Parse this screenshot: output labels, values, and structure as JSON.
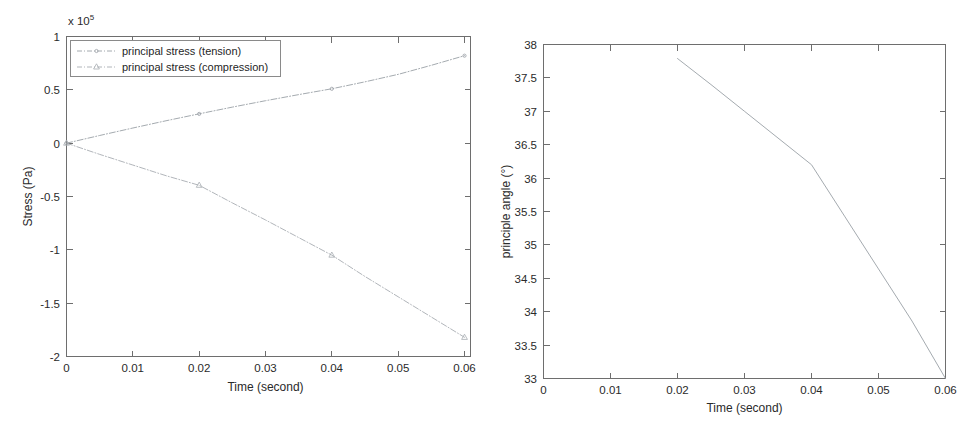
{
  "figures": {
    "stress": {
      "name": "principal stress vs time",
      "exponent_label": "x 10",
      "exponent_power": "5",
      "xlabel": "Time (second)",
      "ylabel": "Stress (Pa)",
      "xticks": [
        "0",
        "0.01",
        "0.02",
        "0.03",
        "0.04",
        "0.05",
        "0.06"
      ],
      "yticks": [
        "1",
        "0.5",
        "0",
        "-0.5",
        "-1",
        "-1.5",
        "-2"
      ],
      "legend": {
        "item1": "principal stress (tension)",
        "item2": "principal stress (compression)"
      }
    },
    "angle": {
      "name": "principle angle vs time",
      "xlabel": "Time (second)",
      "ylabel": "principle angle (°)",
      "xticks": [
        "0",
        "0.01",
        "0.02",
        "0.03",
        "0.04",
        "0.05",
        "0.06"
      ],
      "yticks": [
        "38",
        "37.5",
        "37",
        "36.5",
        "36",
        "35.5",
        "35",
        "34.5",
        "34",
        "33.5",
        "33"
      ]
    }
  },
  "colors": {
    "axis": "#6e6e6e",
    "tension_line": "#9aa0a6",
    "compression_line": "#a8adb2",
    "angle_line": "#9aa0a6",
    "text": "#1f1f1f",
    "background": "#ffffff"
  },
  "chart_data": [
    {
      "type": "line",
      "title": "",
      "xlabel": "Time (second)",
      "ylabel": "Stress (Pa)",
      "y_exponent": 5,
      "y_exponent_label": "x 10^5",
      "xlim": [
        0,
        0.06
      ],
      "ylim": [
        -2,
        1
      ],
      "xticks": [
        0,
        0.01,
        0.02,
        0.03,
        0.04,
        0.05,
        0.06
      ],
      "yticks": [
        1,
        0.5,
        0,
        -0.5,
        -1,
        -1.5,
        -2
      ],
      "grid": false,
      "legend_position": "top-left",
      "series": [
        {
          "name": "principal stress (tension)",
          "marker": "point",
          "linestyle": "dash-dot",
          "x": [
            0,
            0.005,
            0.01,
            0.015,
            0.02,
            0.025,
            0.03,
            0.035,
            0.04,
            0.045,
            0.05,
            0.055,
            0.06
          ],
          "y": [
            0,
            0.072,
            0.142,
            0.21,
            0.275,
            0.338,
            0.398,
            0.455,
            0.51,
            0.575,
            0.645,
            0.73,
            0.82
          ],
          "marker_points": [
            {
              "x": 0,
              "y": 0
            },
            {
              "x": 0.02,
              "y": 0.275
            },
            {
              "x": 0.04,
              "y": 0.615
            },
            {
              "x": 0.06,
              "y": 0.82
            }
          ]
        },
        {
          "name": "principal stress (compression)",
          "marker": "triangle",
          "linestyle": "dash-dot",
          "x": [
            0,
            0.005,
            0.01,
            0.015,
            0.02,
            0.025,
            0.03,
            0.035,
            0.04,
            0.045,
            0.05,
            0.055,
            0.06
          ],
          "y": [
            0,
            -0.105,
            -0.205,
            -0.305,
            -0.395,
            -0.56,
            -0.72,
            -0.885,
            -1.05,
            -1.25,
            -1.44,
            -1.63,
            -1.82
          ],
          "marker_points": [
            {
              "x": 0,
              "y": 0
            },
            {
              "x": 0.02,
              "y": -0.395
            },
            {
              "x": 0.04,
              "y": -1.05
            },
            {
              "x": 0.06,
              "y": -1.82
            }
          ]
        }
      ]
    },
    {
      "type": "line",
      "title": "",
      "xlabel": "Time (second)",
      "ylabel": "principle angle (°)",
      "xlim": [
        0,
        0.06
      ],
      "ylim": [
        33,
        38
      ],
      "xticks": [
        0,
        0.01,
        0.02,
        0.03,
        0.04,
        0.05,
        0.06
      ],
      "yticks": [
        33,
        33.5,
        34,
        34.5,
        35,
        35.5,
        36,
        36.5,
        37,
        37.5,
        38
      ],
      "grid": false,
      "legend_position": "none",
      "series": [
        {
          "name": "principle angle",
          "marker": "none",
          "linestyle": "solid",
          "x": [
            0.02,
            0.025,
            0.03,
            0.035,
            0.04,
            0.045,
            0.05,
            0.055,
            0.06
          ],
          "y": [
            37.79,
            37.4,
            37.0,
            36.6,
            36.2,
            35.42,
            34.64,
            33.86,
            33.0
          ]
        }
      ]
    }
  ]
}
